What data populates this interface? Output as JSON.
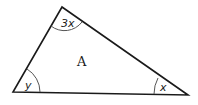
{
  "diagram": {
    "type": "triangle",
    "region_label": "A",
    "angles": [
      {
        "vertex": "top",
        "label": "3x"
      },
      {
        "vertex": "bottom-left",
        "label": "y"
      },
      {
        "vertex": "bottom-right",
        "label": "x"
      }
    ],
    "colors": {
      "stroke": "#1a1a1a",
      "arc": "#555555",
      "background": "#ffffff"
    }
  }
}
